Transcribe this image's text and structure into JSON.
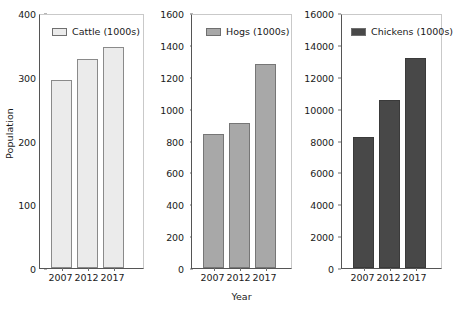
{
  "chart_data": [
    {
      "type": "bar",
      "panel": "cattle",
      "title": "",
      "legend_label": "Cattle (1000s)",
      "legend_position": "top-left-inside",
      "categories": [
        "2007",
        "2012",
        "2017"
      ],
      "values": [
        297,
        330,
        350
      ],
      "xlabel": "",
      "ylabel": "Population",
      "ylim": [
        0,
        400
      ],
      "yticks": [
        0,
        100,
        200,
        300,
        400
      ],
      "ytick_labels": [
        "0",
        "100",
        "200",
        "300",
        "400"
      ],
      "grid": false,
      "color": "#ebebeb",
      "edge_color": "#8a8a8a"
    },
    {
      "type": "bar",
      "panel": "hogs",
      "title": "",
      "legend_label": "Hogs (1000s)",
      "legend_position": "top-left-inside",
      "categories": [
        "2007",
        "2012",
        "2017"
      ],
      "values": [
        845,
        920,
        1290
      ],
      "xlabel": "Year",
      "ylabel": "",
      "ylim": [
        0,
        1600
      ],
      "yticks": [
        0,
        200,
        400,
        600,
        800,
        1000,
        1200,
        1400,
        1600
      ],
      "ytick_labels": [
        "0",
        "200",
        "400",
        "600",
        "800",
        "1000",
        "1200",
        "1400",
        "1600"
      ],
      "grid": false,
      "color": "#a8a8a8",
      "edge_color": "#767676"
    },
    {
      "type": "bar",
      "panel": "chickens",
      "title": "",
      "legend_label": "Chickens (1000s)",
      "legend_position": "top-left-inside",
      "categories": [
        "2007",
        "2012",
        "2017"
      ],
      "values": [
        8300,
        10650,
        13250
      ],
      "xlabel": "",
      "ylabel": "",
      "ylim": [
        0,
        16000
      ],
      "yticks": [
        0,
        2000,
        4000,
        6000,
        8000,
        10000,
        12000,
        14000,
        16000
      ],
      "ytick_labels": [
        "0",
        "2000",
        "4000",
        "6000",
        "8000",
        "10000",
        "12000",
        "14000",
        "16000"
      ],
      "grid": false,
      "color": "#484848",
      "edge_color": "#3a3a3a"
    }
  ],
  "axis_titles": {
    "y": "Population",
    "x": "Year"
  }
}
